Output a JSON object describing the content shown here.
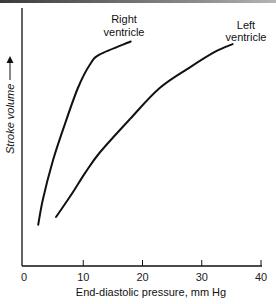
{
  "chart_data": {
    "type": "line",
    "title": "",
    "xlabel": "End-diastolic pressure, mm Hg",
    "ylabel": "Stroke volume",
    "ylabel_arrow": "up",
    "xlim": [
      0,
      40
    ],
    "ylim": [
      0,
      100
    ],
    "y_units": "relative (no ticks shown)",
    "x_ticks": [
      0,
      10,
      20,
      30,
      40
    ],
    "x_tick_labels": [
      "0",
      "10",
      "20",
      "30",
      "40"
    ],
    "y_ticks": [],
    "grid": false,
    "legend": "none (direct curve labels)",
    "series": [
      {
        "name": "Right ventricle",
        "label_lines": [
          "Right",
          "ventricle"
        ],
        "points": [
          [
            2.4,
            16
          ],
          [
            3.2,
            26
          ],
          [
            4.9,
            41
          ],
          [
            6.9,
            55
          ],
          [
            9.1,
            69
          ],
          [
            11.1,
            78
          ],
          [
            12.8,
            82
          ],
          [
            18.0,
            87
          ]
        ]
      },
      {
        "name": "Left ventricle",
        "label_lines": [
          "Left",
          "ventricle"
        ],
        "points": [
          [
            5.4,
            19
          ],
          [
            7.8,
            27
          ],
          [
            10.3,
            36
          ],
          [
            12.8,
            44
          ],
          [
            17.9,
            57
          ],
          [
            22.9,
            69
          ],
          [
            28.0,
            77
          ],
          [
            32.2,
            83
          ],
          [
            35.2,
            86
          ]
        ]
      }
    ]
  },
  "labels": {
    "ylabel": "Stroke volume",
    "xlabel": "End-diastolic pressure, mm Hg",
    "x_ticks": [
      "0",
      "10",
      "20",
      "30",
      "40"
    ],
    "right_line1": "Right",
    "right_line2": "ventricle",
    "left_line1": "Left",
    "left_line2": "ventricle"
  }
}
